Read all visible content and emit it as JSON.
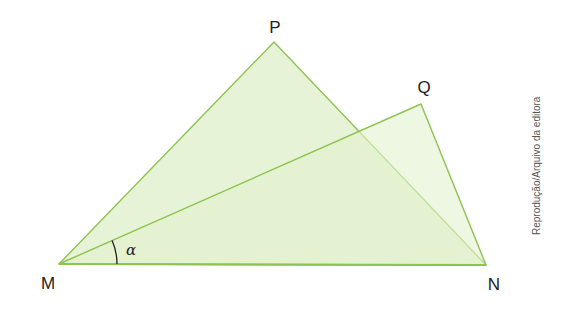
{
  "diagram": {
    "points": {
      "M": {
        "label": "M",
        "x": 59,
        "y": 264
      },
      "N": {
        "label": "N",
        "x": 486,
        "y": 265
      },
      "P": {
        "label": "P",
        "x": 274,
        "y": 42
      },
      "Q": {
        "label": "Q",
        "x": 421,
        "y": 104
      }
    },
    "triangles": [
      "MNP",
      "MNQ"
    ],
    "angle": {
      "label": "α",
      "vertex": "M",
      "between": [
        "MN",
        "MQ"
      ]
    },
    "colors": {
      "fill": "#e3f1cf",
      "stroke": "#8dc34f",
      "arc": "#222222"
    },
    "labels": {
      "M": "M",
      "N": "N",
      "P": "P",
      "Q": "Q",
      "alpha": "α"
    },
    "credit": "Reprodução/Arquivo da editora"
  }
}
